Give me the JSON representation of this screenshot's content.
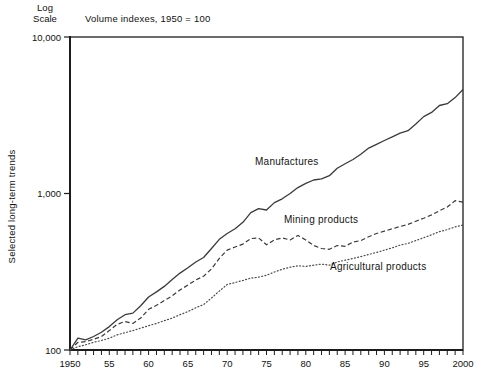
{
  "page": {
    "background": "#ffffff",
    "line_color": "#3a3a3a",
    "text_color": "#111111"
  },
  "header": {
    "title": "Volume indexes, 1950 = 100",
    "log_scale_line1": "Log",
    "log_scale_line2": "Scale"
  },
  "y_axis": {
    "label": "Selected long-term trends",
    "scale": "log",
    "ticks": [
      {
        "label": "10,000",
        "value": 10000
      },
      {
        "label": "1,000",
        "value": 1000
      },
      {
        "label": "100",
        "value": 100
      }
    ]
  },
  "x_axis": {
    "minor_tick_interval_years": 1,
    "ticks": [
      {
        "label": "1950",
        "year": 1950
      },
      {
        "label": "55",
        "year": 1955
      },
      {
        "label": "60",
        "year": 1960
      },
      {
        "label": "65",
        "year": 1965
      },
      {
        "label": "70",
        "year": 1970
      },
      {
        "label": "75",
        "year": 1975
      },
      {
        "label": "80",
        "year": 1980
      },
      {
        "label": "85",
        "year": 1985
      },
      {
        "label": "90",
        "year": 1990
      },
      {
        "label": "95",
        "year": 1995
      },
      {
        "label": "2000",
        "year": 2000
      }
    ]
  },
  "chart_data": {
    "type": "line",
    "title": "Volume indexes, 1950 = 100",
    "xlabel": "",
    "ylabel": "Selected long-term trends",
    "yscale": "log",
    "ylim": [
      100,
      10000
    ],
    "xlim": [
      1950,
      2000
    ],
    "grid": false,
    "legend": "inline-labels-on-chart",
    "x": [
      1950,
      1951,
      1952,
      1953,
      1954,
      1955,
      1956,
      1957,
      1958,
      1959,
      1960,
      1961,
      1962,
      1963,
      1964,
      1965,
      1966,
      1967,
      1968,
      1969,
      1970,
      1971,
      1972,
      1973,
      1974,
      1975,
      1976,
      1977,
      1978,
      1979,
      1980,
      1981,
      1982,
      1983,
      1984,
      1985,
      1986,
      1987,
      1988,
      1989,
      1990,
      1991,
      1992,
      1993,
      1994,
      1995,
      1996,
      1997,
      1998,
      1999,
      2000
    ],
    "series": [
      {
        "name": "Manufactures",
        "style": "solid",
        "color": "#3a3a3a",
        "values": [
          100,
          119,
          116,
          122,
          130,
          141,
          156,
          168,
          172,
          192,
          218,
          235,
          255,
          282,
          310,
          335,
          365,
          390,
          445,
          510,
          555,
          595,
          655,
          755,
          800,
          785,
          875,
          925,
          1000,
          1090,
          1160,
          1220,
          1240,
          1300,
          1450,
          1550,
          1650,
          1780,
          1950,
          2060,
          2180,
          2300,
          2430,
          2520,
          2780,
          3100,
          3300,
          3650,
          3750,
          4100,
          4620
        ]
      },
      {
        "name": "Mining products",
        "style": "dashed",
        "color": "#3a3a3a",
        "values": [
          100,
          112,
          113,
          117,
          122,
          133,
          146,
          152,
          148,
          160,
          182,
          193,
          207,
          222,
          242,
          260,
          280,
          296,
          330,
          385,
          435,
          455,
          475,
          515,
          520,
          470,
          505,
          520,
          505,
          540,
          505,
          465,
          445,
          440,
          465,
          460,
          490,
          500,
          530,
          555,
          575,
          595,
          615,
          635,
          665,
          695,
          730,
          775,
          820,
          900,
          880
        ]
      },
      {
        "name": "Agricultural products",
        "style": "dotted",
        "color": "#4a4a4a",
        "values": [
          100,
          105,
          108,
          112,
          115,
          119,
          125,
          129,
          133,
          138,
          143,
          148,
          154,
          160,
          168,
          176,
          186,
          195,
          215,
          238,
          262,
          270,
          278,
          288,
          292,
          300,
          315,
          328,
          338,
          345,
          342,
          348,
          354,
          348,
          365,
          375,
          385,
          395,
          408,
          420,
          435,
          450,
          468,
          480,
          500,
          522,
          545,
          570,
          588,
          612,
          628
        ]
      }
    ]
  }
}
